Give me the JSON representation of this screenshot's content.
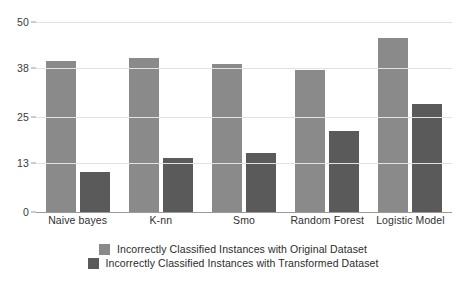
{
  "chart_data": {
    "type": "bar",
    "title": "",
    "xlabel": "",
    "ylabel": "",
    "ylim": [
      0,
      50
    ],
    "yticks": [
      0,
      13,
      25,
      38,
      50
    ],
    "grid": true,
    "legend_position": "bottom",
    "categories": [
      "Naive bayes",
      "K-nn",
      "Smo",
      "Random Forest",
      "Logistic Model"
    ],
    "series": [
      {
        "name": "Incorrectly Classified Instances with Original Dataset",
        "color": "#8a8a8a",
        "values": [
          39.7,
          40.5,
          39.0,
          37.3,
          45.9
        ]
      },
      {
        "name": "Incorrectly Classified Instances with Transformed Dataset",
        "color": "#5a5a5a",
        "values": [
          10.5,
          14.2,
          15.5,
          21.4,
          28.5
        ]
      }
    ]
  },
  "axis": {
    "y_tick_labels": [
      "50",
      "38",
      "25",
      "13",
      "0"
    ]
  },
  "legend": {
    "items": [
      {
        "label": "Incorrectly Classified Instances with Original Dataset"
      },
      {
        "label": "Incorrectly Classified Instances with Transformed Dataset"
      }
    ]
  },
  "colors": {
    "series_original": "#8a8a8a",
    "series_transformed": "#5a5a5a",
    "gridline": "#e2e2e2",
    "axis": "#9a9a9a",
    "background": "#ffffff"
  }
}
